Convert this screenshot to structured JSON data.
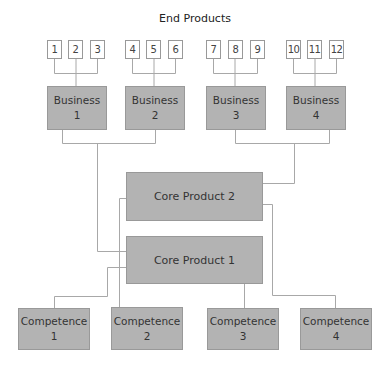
{
  "title": "End Products",
  "end_products": [
    "1",
    "2",
    "3",
    "4",
    "5",
    "6",
    "7",
    "8",
    "9",
    "10",
    "11",
    "12"
  ],
  "businesses": [
    "Business\n1",
    "Business\n2",
    "Business\n3",
    "Business\n4"
  ],
  "core_products": [
    "Core Product 2",
    "Core Product 1"
  ],
  "competences": [
    "Competence\n1",
    "Competence\n2",
    "Competence\n3",
    "Competence\n4"
  ],
  "colors": {
    "box_fill": "#b3b3b3",
    "box_border": "#999999",
    "line": "#a8a8a8"
  }
}
